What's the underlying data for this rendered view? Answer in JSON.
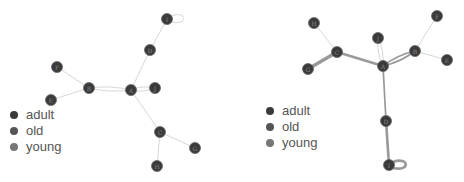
{
  "legend_items": [
    {
      "label": "adult",
      "color": "#3a3a3a"
    },
    {
      "label": "old",
      "color": "#555555"
    },
    {
      "label": "young",
      "color": "#777777"
    }
  ],
  "colors": {
    "node_fill": "#3a3a3a",
    "node_stroke": "#666666",
    "edge_light": "#cccccc",
    "edge_heavy": "#999999",
    "legend_text": "#555555"
  },
  "graphs": [
    {
      "name": "left-graph",
      "nodes": [
        {
          "id": "A",
          "x": 131,
          "y": 90
        },
        {
          "id": "B",
          "x": 89,
          "y": 88
        },
        {
          "id": "C",
          "x": 160,
          "y": 132
        },
        {
          "id": "D",
          "x": 150,
          "y": 50
        },
        {
          "id": "E",
          "x": 51,
          "y": 100
        },
        {
          "id": "F",
          "x": 57,
          "y": 67
        },
        {
          "id": "G",
          "x": 195,
          "y": 148
        },
        {
          "id": "H",
          "x": 157,
          "y": 166
        },
        {
          "id": "I",
          "x": 167,
          "y": 19
        },
        {
          "id": "J",
          "x": 155,
          "y": 88
        }
      ],
      "edges": [
        {
          "source": "A",
          "target": "B",
          "weight": 1,
          "double": true
        },
        {
          "source": "A",
          "target": "J",
          "weight": 1,
          "double": true
        },
        {
          "source": "A",
          "target": "D",
          "weight": 1
        },
        {
          "source": "A",
          "target": "C",
          "weight": 1
        },
        {
          "source": "D",
          "target": "I",
          "weight": 1
        },
        {
          "source": "B",
          "target": "F",
          "weight": 1
        },
        {
          "source": "B",
          "target": "E",
          "weight": 1
        },
        {
          "source": "C",
          "target": "G",
          "weight": 1
        },
        {
          "source": "C",
          "target": "H",
          "weight": 1
        },
        {
          "source": "I",
          "target": "I",
          "weight": 1,
          "loop": true
        }
      ],
      "legend": {
        "x": 10,
        "y": 107
      }
    },
    {
      "name": "right-graph",
      "nodes": [
        {
          "id": "A",
          "x": 151,
          "y": 66
        },
        {
          "id": "B",
          "x": 183,
          "y": 51
        },
        {
          "id": "C",
          "x": 105,
          "y": 52
        },
        {
          "id": "D",
          "x": 154,
          "y": 121
        },
        {
          "id": "E",
          "x": 215,
          "y": 60
        },
        {
          "id": "F",
          "x": 205,
          "y": 16
        },
        {
          "id": "G",
          "x": 76,
          "y": 69
        },
        {
          "id": "H",
          "x": 82,
          "y": 23
        },
        {
          "id": "I",
          "x": 157,
          "y": 165
        },
        {
          "id": "J",
          "x": 146,
          "y": 38
        }
      ],
      "edges": [
        {
          "source": "A",
          "target": "C",
          "weight": 3
        },
        {
          "source": "A",
          "target": "B",
          "weight": 2,
          "double": true
        },
        {
          "source": "A",
          "target": "J",
          "weight": 1,
          "double": true
        },
        {
          "source": "A",
          "target": "D",
          "weight": 2
        },
        {
          "source": "D",
          "target": "I",
          "weight": 3
        },
        {
          "source": "C",
          "target": "G",
          "weight": 4
        },
        {
          "source": "C",
          "target": "H",
          "weight": 1
        },
        {
          "source": "B",
          "target": "F",
          "weight": 1
        },
        {
          "source": "B",
          "target": "E",
          "weight": 1
        },
        {
          "source": "I",
          "target": "I",
          "weight": 3,
          "loop": true
        }
      ],
      "legend": {
        "x": 34,
        "y": 103
      }
    }
  ]
}
